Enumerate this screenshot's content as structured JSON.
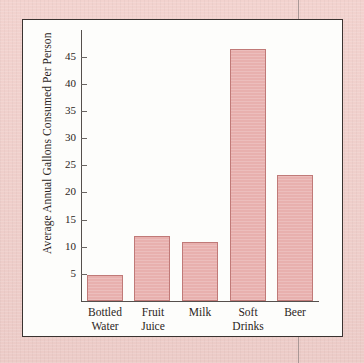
{
  "figure": {
    "frame_color": "#3a3330",
    "mat_color": "#f0cfcb",
    "plot_background": "#fdfdfb"
  },
  "chart_data": {
    "type": "bar",
    "title": "",
    "subtitle": "",
    "xlabel": "",
    "ylabel": "Average Annual Gallons Consumed Per Person",
    "categories": [
      "Bottled Water",
      "Fruit Juice",
      "Milk",
      "Soft Drinks",
      "Beer"
    ],
    "category_lines": [
      [
        "Bottled",
        "Water"
      ],
      [
        "Fruit",
        "Juice"
      ],
      [
        "Milk",
        ""
      ],
      [
        "Soft",
        "Drinks"
      ],
      [
        "Beer",
        ""
      ]
    ],
    "values": [
      4.7,
      12.0,
      10.8,
      46.4,
      23.2
    ],
    "yticks": [
      5,
      10,
      15,
      20,
      25,
      30,
      35,
      40,
      45
    ],
    "ylim": [
      0,
      49
    ],
    "grid": false,
    "legend": null,
    "bar_fill": "#e8b0ae",
    "bar_border": "#c07a78",
    "axis_color": "#55504d"
  }
}
